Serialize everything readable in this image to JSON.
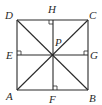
{
  "diagram": {
    "type": "geometry-square",
    "points": {
      "A": {
        "label": "A",
        "x": 17,
        "y": 90
      },
      "B": {
        "label": "B",
        "x": 88,
        "y": 90
      },
      "C": {
        "label": "C",
        "x": 88,
        "y": 20
      },
      "D": {
        "label": "D",
        "x": 17,
        "y": 20
      },
      "E": {
        "label": "E",
        "x": 17,
        "y": 55
      },
      "F": {
        "label": "F",
        "x": 53,
        "y": 90
      },
      "G": {
        "label": "G",
        "x": 88,
        "y": 55
      },
      "H": {
        "label": "H",
        "x": 53,
        "y": 20
      },
      "P": {
        "label": "P",
        "x": 53,
        "y": 55
      }
    },
    "segments": [
      "AB",
      "BC",
      "CD",
      "DA",
      "AC",
      "BD",
      "EG",
      "HF"
    ],
    "right_angle_marks": [
      "H",
      "E",
      "G",
      "F"
    ],
    "colors": {
      "stroke": "#2a2a2a",
      "background": "#ffffff"
    }
  }
}
